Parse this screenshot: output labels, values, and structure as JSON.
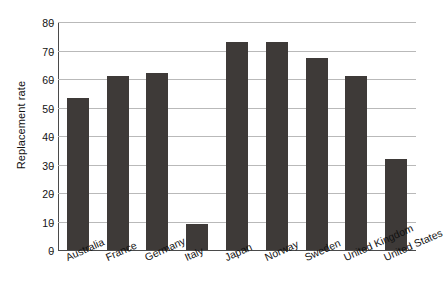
{
  "chart_data": {
    "type": "bar",
    "title": "",
    "subtitle": "",
    "xlabel": "",
    "ylabel": "Replacement rate",
    "ylim": [
      0,
      80
    ],
    "yticks": [
      0,
      10,
      20,
      30,
      40,
      50,
      60,
      70,
      80
    ],
    "ytick_labels": [
      "0",
      "10",
      "20",
      "30",
      "40",
      "50",
      "60",
      "70",
      "80"
    ],
    "grid": true,
    "legend": false,
    "legend_position": "none",
    "bar_color": "#3e3a38",
    "grid_color": "#b9b9b9",
    "axis_color": "#4a4a4a",
    "background_color": "#ffffff",
    "categories": [
      "Australia",
      "France",
      "Germany",
      "Italy",
      "Japan",
      "Norway",
      "Sweden",
      "United Kingdom",
      "United States"
    ],
    "values": [
      53.5,
      61.0,
      62.0,
      9.3,
      73.0,
      73.0,
      67.5,
      61.0,
      32.0
    ]
  }
}
